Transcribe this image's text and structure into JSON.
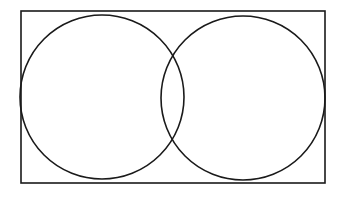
{
  "diagram": {
    "type": "venn",
    "set_count": 2,
    "stroke_color": "#1a1a1a",
    "background": "#ffffff",
    "universe": {
      "label": ""
    },
    "sets": [
      {
        "id": "A",
        "label": ""
      },
      {
        "id": "B",
        "label": ""
      }
    ]
  }
}
